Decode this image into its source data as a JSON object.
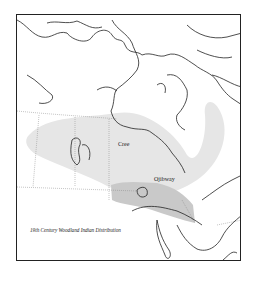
{
  "map": {
    "caption": "19th Century Woodland Indian Distribution",
    "regions": [
      {
        "name": "Cree",
        "label": "Cree",
        "fill": "#e4e4e4"
      },
      {
        "name": "Ojibway",
        "label": "Ojibway",
        "fill": "#c8c8c8"
      }
    ],
    "colors": {
      "outline": "#222222",
      "background": "#ffffff",
      "border_dotted": "#888888"
    }
  }
}
